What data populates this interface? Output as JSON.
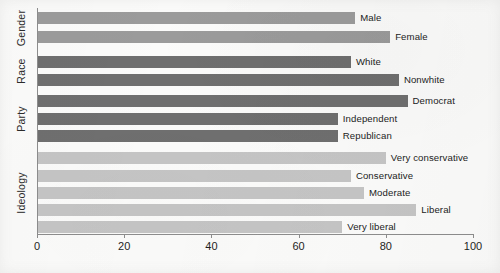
{
  "chart_data": {
    "type": "bar",
    "orientation": "horizontal",
    "title": "",
    "xlabel": "",
    "ylabel": "",
    "xlim": [
      0,
      100
    ],
    "xticks": [
      0,
      20,
      40,
      60,
      80,
      100
    ],
    "grid": false,
    "legend": false,
    "group_labels": [
      "Gender",
      "Race",
      "Party",
      "Ideology"
    ],
    "groups": [
      {
        "name": "Gender",
        "color": "#9b9b9b",
        "categories": [
          "Male",
          "Female"
        ],
        "values": [
          73,
          81
        ]
      },
      {
        "name": "Race",
        "color": "#6f6f6f",
        "categories": [
          "White",
          "Nonwhite"
        ],
        "values": [
          72,
          83
        ]
      },
      {
        "name": "Party",
        "color": "#6f6f6f",
        "categories": [
          "Democrat",
          "Independent",
          "Republican"
        ],
        "values": [
          85,
          69,
          69
        ]
      },
      {
        "name": "Ideology",
        "color": "#c5c5c5",
        "categories": [
          "Very conservative",
          "Conservative",
          "Moderate",
          "Liberal",
          "Very liberal"
        ],
        "values": [
          80,
          72,
          75,
          87,
          70
        ]
      }
    ],
    "bars": [
      {
        "label": "Male",
        "value": 73,
        "group": "Gender",
        "color": "#9b9b9b"
      },
      {
        "label": "Female",
        "value": 81,
        "group": "Gender",
        "color": "#9b9b9b"
      },
      {
        "label": "White",
        "value": 72,
        "group": "Race",
        "color": "#6f6f6f"
      },
      {
        "label": "Nonwhite",
        "value": 83,
        "group": "Race",
        "color": "#6f6f6f"
      },
      {
        "label": "Democrat",
        "value": 85,
        "group": "Party",
        "color": "#6f6f6f"
      },
      {
        "label": "Independent",
        "value": 69,
        "group": "Party",
        "color": "#6f6f6f"
      },
      {
        "label": "Republican",
        "value": 69,
        "group": "Party",
        "color": "#6f6f6f"
      },
      {
        "label": "Very conservative",
        "value": 80,
        "group": "Ideology",
        "color": "#c5c5c5"
      },
      {
        "label": "Conservative",
        "value": 72,
        "group": "Ideology",
        "color": "#c5c5c5"
      },
      {
        "label": "Moderate",
        "value": 75,
        "group": "Ideology",
        "color": "#c5c5c5"
      },
      {
        "label": "Liberal",
        "value": 87,
        "group": "Ideology",
        "color": "#c5c5c5"
      },
      {
        "label": "Very liberal",
        "value": 70,
        "group": "Ideology",
        "color": "#c5c5c5"
      }
    ],
    "tick_labels": [
      "0",
      "20",
      "40",
      "60",
      "80",
      "100"
    ]
  },
  "colors": {
    "gender": "#9b9b9b",
    "race": "#6f6f6f",
    "party": "#6f6f6f",
    "ideology": "#c5c5c5",
    "axis": "#8d8d8d",
    "text": "#232323",
    "background": "#fbfbfa"
  }
}
